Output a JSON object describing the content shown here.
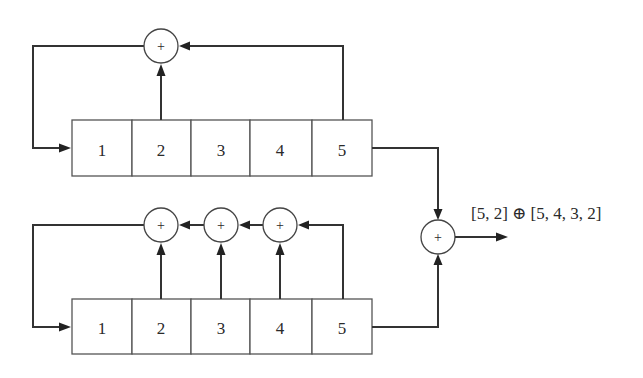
{
  "registers": {
    "top": {
      "cells": [
        "1",
        "2",
        "3",
        "4",
        "5"
      ],
      "taps": [
        "2",
        "5"
      ]
    },
    "bottom": {
      "cells": [
        "1",
        "2",
        "3",
        "4",
        "5"
      ],
      "taps": [
        "2",
        "3",
        "4",
        "5"
      ]
    }
  },
  "adder_symbol": "+",
  "output_label": "[5, 2] ⊕ [5, 4, 3, 2]"
}
